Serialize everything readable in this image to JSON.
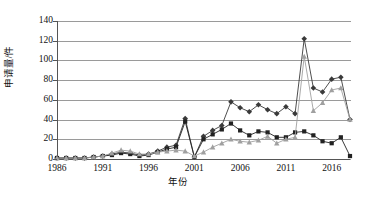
{
  "chart_data": {
    "type": "line",
    "title": "",
    "xlabel": "年份",
    "ylabel": "申请量/件",
    "ylim": [
      0,
      140
    ],
    "xlim": [
      1986,
      2018
    ],
    "grid": true,
    "legend_position": "none",
    "ytick_labels": [
      "0",
      "20",
      "40",
      "60",
      "80",
      "100",
      "120",
      "140"
    ],
    "ytick_values": [
      0,
      20,
      40,
      60,
      80,
      100,
      120,
      140
    ],
    "xtick_labels": [
      "1986",
      "1991",
      "1996",
      "2001",
      "2006",
      "2011",
      "2016"
    ],
    "xtick_values": [
      1986,
      1991,
      1996,
      2001,
      2006,
      2011,
      2016
    ],
    "x": [
      1986,
      1987,
      1988,
      1989,
      1990,
      1991,
      1992,
      1993,
      1994,
      1995,
      1996,
      1997,
      1998,
      1999,
      2000,
      2001,
      2002,
      2003,
      2004,
      2005,
      2006,
      2007,
      2008,
      2009,
      2010,
      2011,
      2012,
      2013,
      2014,
      2015,
      2016,
      2017,
      2018
    ],
    "series": [
      {
        "name": "series-diamond-dark",
        "marker": "diamond",
        "color": "#3a3a3a",
        "values": [
          1,
          1,
          1,
          1,
          2,
          3,
          5,
          7,
          6,
          4,
          5,
          8,
          12,
          14,
          41,
          2,
          23,
          29,
          34,
          58,
          52,
          48,
          55,
          50,
          46,
          53,
          46,
          122,
          72,
          68,
          81,
          83,
          40
        ]
      },
      {
        "name": "series-square-dark",
        "marker": "square",
        "color": "#222222",
        "values": [
          1,
          1,
          1,
          1,
          2,
          3,
          4,
          6,
          5,
          3,
          4,
          7,
          10,
          12,
          38,
          2,
          20,
          25,
          30,
          36,
          29,
          24,
          28,
          27,
          22,
          22,
          27,
          28,
          24,
          18,
          16,
          22,
          3
        ]
      },
      {
        "name": "series-triangle-light",
        "marker": "triangle",
        "color": "#a0a0a0",
        "values": [
          1,
          1,
          1,
          1,
          2,
          3,
          6,
          9,
          8,
          5,
          5,
          7,
          8,
          9,
          8,
          3,
          7,
          12,
          16,
          20,
          18,
          17,
          19,
          23,
          16,
          20,
          22,
          104,
          49,
          57,
          70,
          72,
          40
        ]
      }
    ]
  }
}
